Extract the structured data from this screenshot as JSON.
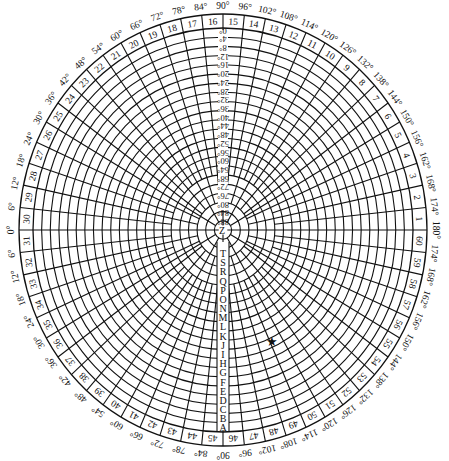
{
  "diagram": {
    "colors": {
      "line": "#111111",
      "background": "#ffffff",
      "marker": "#000000"
    },
    "sector_count": 60,
    "sector_numbers": [
      "1",
      "2",
      "3",
      "4",
      "5",
      "6",
      "7",
      "8",
      "9",
      "10",
      "11",
      "12",
      "13",
      "14",
      "15",
      "16",
      "17",
      "18",
      "19",
      "20",
      "21",
      "22",
      "23",
      "24",
      "25",
      "26",
      "27",
      "28",
      "29",
      "30",
      "31",
      "32",
      "33",
      "34",
      "35",
      "36",
      "37",
      "38",
      "39",
      "40",
      "41",
      "42",
      "43",
      "44",
      "45",
      "46",
      "47",
      "48",
      "49",
      "50",
      "51",
      "52",
      "53",
      "54",
      "55",
      "56",
      "57",
      "58",
      "59",
      "60"
    ],
    "degree_labels": [
      "180°",
      "174°",
      "168°",
      "162°",
      "156°",
      "150°",
      "144°",
      "138°",
      "132°",
      "126°",
      "120°",
      "114°",
      "108°",
      "102°",
      "96°",
      "90°",
      "84°",
      "78°",
      "72°",
      "66°",
      "60°",
      "54°",
      "48°",
      "42°",
      "36°",
      "30°",
      "24°",
      "18°",
      "12°",
      "6°",
      "0°",
      "6°",
      "12°",
      "18°",
      "24°",
      "30°",
      "36°",
      "42°",
      "48°",
      "54°",
      "60°",
      "66°",
      "72°",
      "78°",
      "84°",
      "90°",
      "96°",
      "102°",
      "108°",
      "114°",
      "120°",
      "126°",
      "132°",
      "138°",
      "144°",
      "150°",
      "156°",
      "162°",
      "168°",
      "174°"
    ],
    "ring_letters": [
      "A",
      "B",
      "C",
      "D",
      "E",
      "F",
      "G",
      "H",
      "I",
      "J",
      "K",
      "L",
      "M",
      "N",
      "O",
      "P",
      "Q",
      "R",
      "S",
      "T"
    ],
    "center_letter": "Z",
    "latitude_scale": [
      "0°",
      "4°",
      "8°",
      "12°",
      "16°",
      "20°",
      "24°",
      "28°",
      "32°",
      "36°",
      "40°",
      "44°",
      "48°",
      "52°",
      "56°",
      "60°",
      "64°",
      "68°",
      "72°",
      "76°",
      "80°",
      "84°",
      "88°"
    ],
    "ring_count": 22,
    "marker": {
      "name": "star",
      "glyph": "★",
      "sector": "54",
      "ring": "K"
    }
  }
}
